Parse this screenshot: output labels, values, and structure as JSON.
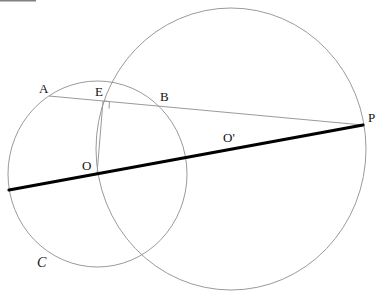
{
  "diagram": {
    "type": "geometry",
    "labels": {
      "A": "A",
      "E": "E",
      "B": "B",
      "P": "P",
      "O": "O",
      "O_prime": "O'",
      "C": "C"
    },
    "colors": {
      "thin_line": "#9a9a9a",
      "thick_line": "#000000",
      "label": "#111111",
      "background": "#ffffff"
    },
    "points": {
      "A": [
        49,
        96
      ],
      "E": [
        103,
        101
      ],
      "B": [
        157,
        104
      ],
      "P": [
        363,
        125
      ],
      "O": [
        97,
        174
      ],
      "O_prime": [
        229,
        146
      ],
      "line_start": [
        9,
        190
      ]
    },
    "circles": [
      {
        "name": "circle-C",
        "center": "O",
        "cx": 97.5,
        "cy": 174,
        "rx": 89.5,
        "ry": 93
      },
      {
        "name": "circle-O-prime",
        "center": "O'",
        "cx": 231,
        "cy": 149,
        "rx": 135,
        "ry": 141
      }
    ],
    "right_angle_at": "E"
  }
}
